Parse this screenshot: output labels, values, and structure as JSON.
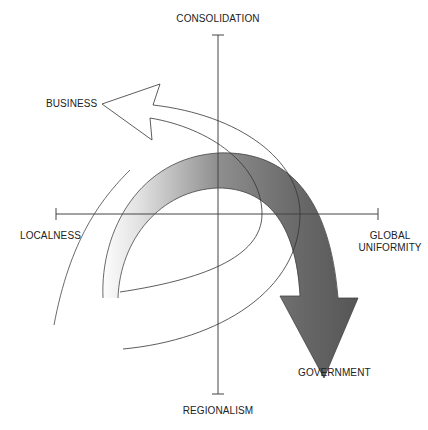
{
  "diagram": {
    "axes": {
      "top": "CONSOLIDATION",
      "bottom": "REGIONALISM",
      "left": "LOCALNESS",
      "right_line1": "GLOBAL",
      "right_line2": "UNIFORMITY"
    },
    "arrows": {
      "business": "BUSINESS",
      "government": "GOVERNMENT"
    },
    "colors": {
      "axis": "#444444",
      "outline": "#333333",
      "gray_arrow_light": "#f4f4f4",
      "gray_arrow_dark": "#555555",
      "white_arrow_fill": "#ffffff"
    }
  }
}
